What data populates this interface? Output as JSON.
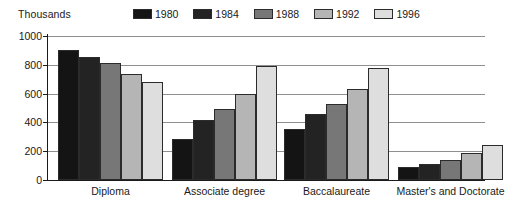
{
  "chart_data": {
    "type": "bar",
    "title": "",
    "subtitle": "",
    "unit_label": "Thousands",
    "xlabel": "",
    "ylabel": "Thousands",
    "ylim": [
      0,
      1000
    ],
    "yticks": [
      0,
      200,
      400,
      600,
      800,
      1000
    ],
    "ytick_labels": [
      "0",
      "200",
      "400",
      "600",
      "800",
      "1000"
    ],
    "grid": true,
    "legend_position": "top-right",
    "categories": [
      "Diploma",
      "Associate degree",
      "Baccalaureate",
      "Master's and Doctorate"
    ],
    "series": [
      {
        "name": "1980",
        "color": "#141414",
        "values": [
          900,
          285,
          355,
          90
        ]
      },
      {
        "name": "1984",
        "color": "#232323",
        "values": [
          855,
          420,
          455,
          110
        ]
      },
      {
        "name": "1988",
        "color": "#777777",
        "values": [
          815,
          490,
          525,
          140
        ]
      },
      {
        "name": "1992",
        "color": "#b5b5b5",
        "values": [
          735,
          600,
          630,
          190
        ]
      },
      {
        "name": "1996",
        "color": "#dedede",
        "values": [
          680,
          790,
          775,
          245
        ]
      }
    ]
  }
}
